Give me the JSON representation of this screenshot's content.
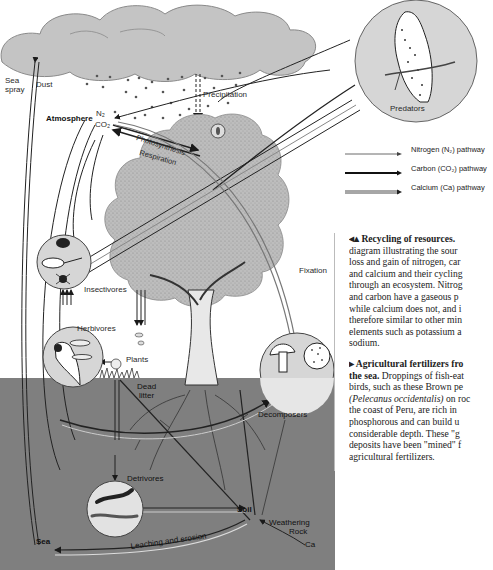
{
  "diagram": {
    "title": "Recycling of resources",
    "labels": {
      "sea_spray": "Sea spray",
      "sea_spray_line1": "Sea",
      "sea_spray_line2": "spray",
      "dust": "Dust",
      "atmosphere": "Atmosphere",
      "n2": "N₂",
      "co2": "CO₂",
      "precipitation": "Precipitation",
      "photosynthesis": "Photosynthesis",
      "respiration": "Respiration",
      "predators": "Predators",
      "insectivores": "Insectivores",
      "herbivores": "Herbivores",
      "plants": "Plants",
      "fixation": "Fixation",
      "dead_litter_line1": "Dead",
      "dead_litter_line2": "litter",
      "decomposers": "Decomposers",
      "detrivores": "Detrivores",
      "soil": "Soil",
      "weathering": "Weathering",
      "rock": "Rock",
      "ca": "Ca",
      "sea": "Sea",
      "leaching": "Leaching and erosion"
    }
  },
  "legend": {
    "items": [
      {
        "label": "Nitrogen (N₂) pathway",
        "style": "thin"
      },
      {
        "label": "Carbon (CO₂) pathway",
        "style": "thick"
      },
      {
        "label": "Calcium (Ca) pathway",
        "style": "double"
      }
    ]
  },
  "caption": {
    "p1_head": "◂▴ Recycling of resources.",
    "p1_lines": [
      "diagram illustrating the sour",
      "loss and gain of nitrogen, car",
      "and calcium and their cycling",
      "through an ecosystem. Nitrog",
      "and carbon have a gaseous p",
      "while calcium does not, and i",
      "therefore similar to other min",
      "elements such as potassium a",
      "sodium."
    ],
    "p2_head_line1": "▸ Agricultural fertilizers fro",
    "p2_head_line2": "the sea.",
    "p2_line2_rest": " Droppings of fish-eat",
    "p2_lines": [
      "birds, such as these Brown pe"
    ],
    "p2_species": "(Pelecanus occidentalis)",
    "p2_species_rest": " on roc",
    "p2_more": [
      "the coast of Peru, are rich in",
      "phosphorous and can build u",
      "considerable depth. These \"g",
      "deposits have been \"mined\" f",
      "agricultural fertilizers."
    ]
  },
  "colors": {
    "ground": "#7f7f7f",
    "cloud": "#c4c4c4",
    "canopy": "#bdbdbd",
    "circle": "#d8d8d8",
    "line": "#1a1a1a"
  }
}
